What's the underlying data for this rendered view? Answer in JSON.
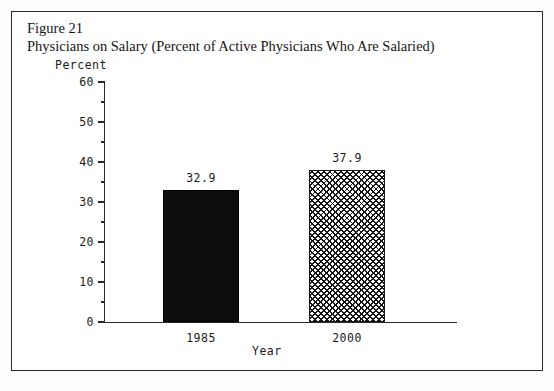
{
  "figure": {
    "number": "Figure 21",
    "title": "Physicians on Salary (Percent of Active Physicians Who Are Salaried)"
  },
  "chart_data": {
    "type": "bar",
    "title": "Physicians on Salary (Percent of Active Physicians Who Are Salaried)",
    "xlabel": "Year",
    "ylabel": "Percent",
    "categories": [
      "1985",
      "2000"
    ],
    "values": [
      32.9,
      37.9
    ],
    "value_labels": [
      "32.9",
      "37.9"
    ],
    "series": [
      {
        "name": "Percent of Active Physicians Who Are Salaried",
        "values": [
          32.9,
          37.9
        ]
      }
    ],
    "ylim": [
      0,
      60
    ],
    "yticks": [
      0,
      10,
      20,
      30,
      40,
      50,
      60
    ],
    "ytick_labels": [
      "0",
      "10",
      "20",
      "30",
      "40",
      "50",
      "60"
    ],
    "yticks_minor": [
      5,
      15,
      25,
      35,
      45,
      55
    ],
    "grid": false,
    "legend": false,
    "bar_styles": [
      "solid-black",
      "cross-hatch"
    ],
    "colors": {
      "bar_solid": "#0d0d0d",
      "bar_hatch_line": "#151515",
      "bar_hatch_background": "#ffffff",
      "axis": "#2a2a2a",
      "text": "#1a1a1a",
      "frame": "#2b2b2b",
      "page_background": "#ffffff"
    }
  }
}
